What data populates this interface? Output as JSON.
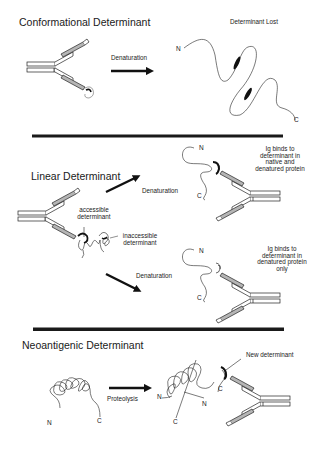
{
  "sections": {
    "conformational": {
      "title": "Conformational Determinant",
      "arrow_label": "Denaturation",
      "result_label": "Determinant Lost",
      "n_terminus": "N",
      "c_terminus": "C"
    },
    "linear": {
      "title": "Linear Determinant",
      "accessible_label_line1": "accessible",
      "accessible_label_line2": "determinant",
      "inaccessible_label_line1": "inaccessible",
      "inaccessible_label_line2": "determinant",
      "upper_arrow_label": "Denaturation",
      "lower_arrow_label": "Denaturation",
      "upper_result": {
        "lines": [
          "Ig binds to",
          "determinant in",
          "native and",
          "denatured protein"
        ],
        "n_terminus": "N",
        "c_terminus": "C"
      },
      "lower_result": {
        "lines": [
          "Ig binds to",
          "determinant in",
          "denatured protein",
          "only"
        ],
        "n_terminus": "N",
        "c_terminus": "C"
      }
    },
    "neoantigenic": {
      "title": "Neoantigenic Determinant",
      "arrow_label": "Proteolysis",
      "new_label": "New determinant",
      "before_n": "N",
      "before_c": "C",
      "after_n1": "N",
      "after_n2": "N",
      "after_c1": "C",
      "after_c2": "C"
    }
  },
  "colors": {
    "ink": "#1a1a1a",
    "shade": "#b5b5b5",
    "background": "#ffffff"
  }
}
